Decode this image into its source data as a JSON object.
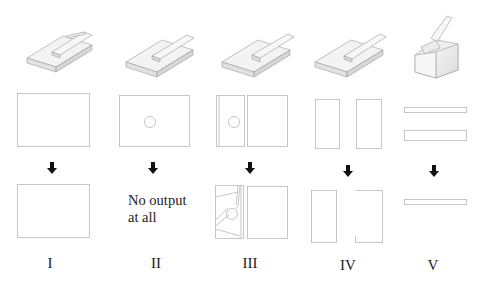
{
  "figure": {
    "columns": [
      {
        "id": "I",
        "label": "I",
        "output_note": null
      },
      {
        "id": "II",
        "label": "II",
        "output_note": "No output\nat all"
      },
      {
        "id": "III",
        "label": "III",
        "output_note": null
      },
      {
        "id": "IV",
        "label": "IV",
        "output_note": null
      },
      {
        "id": "V",
        "label": "V",
        "output_note": null
      }
    ],
    "note_line1": "No output",
    "note_line2": "at all",
    "arrow_icon": "down-arrow-icon",
    "colors": {
      "outline": "#b8b8b8",
      "arrow": "#111111",
      "text": "#222222",
      "shade": "#d8d8d8"
    }
  }
}
